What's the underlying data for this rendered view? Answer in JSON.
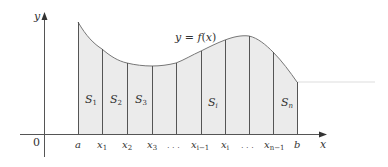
{
  "figure": {
    "curve_label": "y = f(x)",
    "curve_label_parts": {
      "y": "y",
      "eq": " = ",
      "f": "f",
      "paren_open": "(",
      "x": "x",
      "paren_close": ")"
    },
    "axes": {
      "x_label": "x",
      "y_label": "y",
      "origin_label": "0"
    },
    "colors": {
      "fill": "#ebebeb",
      "lines": "#555555",
      "axis": "#444444",
      "curve": "#666666",
      "text": "#333333"
    },
    "tick_labels": [
      {
        "main": "a",
        "sub": "",
        "x": 78
      },
      {
        "main": "x",
        "sub": "1",
        "x": 102
      },
      {
        "main": "x",
        "sub": "2",
        "x": 127
      },
      {
        "main": "x",
        "sub": "3",
        "x": 152
      },
      {
        "main": ". . .",
        "sub": "",
        "x": 170
      },
      {
        "main": "x",
        "sub": "i−1",
        "x": 196
      },
      {
        "main": "x",
        "sub": "i",
        "x": 224
      },
      {
        "main": ". . .",
        "sub": "",
        "x": 244
      },
      {
        "main": "x",
        "sub": "n−1",
        "x": 268
      },
      {
        "main": "b",
        "sub": "",
        "x": 297
      }
    ],
    "strip_labels": [
      {
        "main": "S",
        "sub": "1",
        "x": 86,
        "y": 100
      },
      {
        "main": "S",
        "sub": "2",
        "x": 110,
        "y": 100
      },
      {
        "main": "S",
        "sub": "3",
        "x": 135,
        "y": 100
      },
      {
        "main": "S",
        "sub": "i",
        "x": 207,
        "y": 103
      },
      {
        "main": "S",
        "sub": "n",
        "x": 280,
        "y": 103
      }
    ],
    "partition_x": [
      78,
      102,
      127,
      152,
      176,
      201,
      225,
      249,
      273,
      297
    ],
    "curve_y": [
      22,
      49,
      63,
      66,
      63,
      51,
      40,
      36,
      52,
      82
    ]
  }
}
